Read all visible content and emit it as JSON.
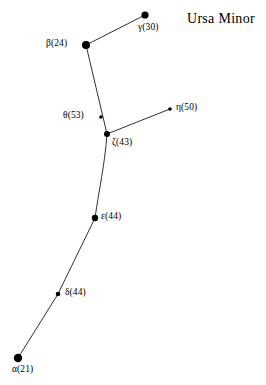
{
  "title": {
    "text": "Ursa Minor",
    "x": 187,
    "y": 11
  },
  "canvas": {
    "width": 266,
    "height": 385,
    "background": "#ffffff",
    "ink": "#000000"
  },
  "chart_data": {
    "type": "scatter",
    "title": "Ursa Minor",
    "xlabel": "",
    "ylabel": "",
    "grid": false,
    "legend": null,
    "x": [
      145,
      86,
      101,
      107,
      170,
      95,
      58,
      18
    ],
    "y": [
      15,
      45,
      117,
      134,
      109,
      218,
      294,
      358
    ],
    "point_labels": [
      "γ(30)",
      "β(24)",
      "θ(53)",
      "ζ(43)",
      "η(50)",
      "ε(44)",
      "δ(44)",
      "α(21)"
    ],
    "values": [
      30,
      24,
      53,
      43,
      50,
      44,
      44,
      21
    ],
    "stars": [
      {
        "id": "gamma",
        "greek": "γ",
        "number": "30",
        "label": "γ(30)",
        "x": 145,
        "y": 15,
        "r": 3.6,
        "label_x": 138,
        "label_y": 22
      },
      {
        "id": "beta",
        "greek": "β",
        "number": "24",
        "label": "β(24)",
        "x": 86,
        "y": 45,
        "r": 4.1,
        "label_x": 46,
        "label_y": 38
      },
      {
        "id": "theta",
        "greek": "θ",
        "number": "53",
        "label": "θ(53)",
        "x": 101,
        "y": 117,
        "r": 1.8,
        "label_x": 63,
        "label_y": 110
      },
      {
        "id": "zeta",
        "greek": "ζ",
        "number": "43",
        "label": "ζ(43)",
        "x": 107,
        "y": 134,
        "r": 3.0,
        "label_x": 112,
        "label_y": 137
      },
      {
        "id": "eta",
        "greek": "η",
        "number": "50",
        "label": "η(50)",
        "x": 170,
        "y": 109,
        "r": 1.8,
        "label_x": 176,
        "label_y": 102
      },
      {
        "id": "epsilon",
        "greek": "ε",
        "number": "44",
        "label": "ε(44)",
        "x": 95,
        "y": 218,
        "r": 3.2,
        "label_x": 101,
        "label_y": 211
      },
      {
        "id": "delta",
        "greek": "δ",
        "number": "44",
        "label": "δ(44)",
        "x": 58,
        "y": 294,
        "r": 2.3,
        "label_x": 65,
        "label_y": 287
      },
      {
        "id": "alpha",
        "greek": "α",
        "number": "21",
        "label": "α(21)",
        "x": 18,
        "y": 358,
        "r": 4.2,
        "label_x": 12,
        "label_y": 364
      }
    ],
    "links": [
      {
        "id": "gamma-beta",
        "from": "gamma",
        "to": "beta",
        "path": "M145,15 L86,45"
      },
      {
        "id": "beta-zeta",
        "from": "beta",
        "to": "zeta",
        "path": "M86,45 L107,134"
      },
      {
        "id": "zeta-eta",
        "from": "zeta",
        "to": "eta",
        "path": "M107,134 L170,109"
      },
      {
        "id": "zeta-epsilon",
        "from": "zeta",
        "to": "epsilon",
        "path": "M107,134 C105,163 99,190 95,218"
      },
      {
        "id": "epsilon-delta",
        "from": "epsilon",
        "to": "delta",
        "path": "M95,218 L58,294"
      },
      {
        "id": "delta-alpha",
        "from": "delta",
        "to": "alpha",
        "path": "M58,294 L18,358"
      }
    ]
  }
}
